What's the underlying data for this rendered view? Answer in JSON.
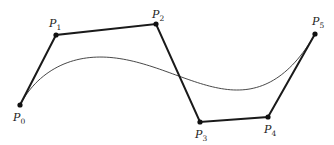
{
  "diagram": {
    "type": "bezier-curve-control-polygon",
    "points": [
      {
        "name": "P",
        "sub": "0",
        "x": 20,
        "y": 105,
        "lx": 13,
        "ly": 121
      },
      {
        "name": "P",
        "sub": "1",
        "x": 56,
        "y": 35,
        "lx": 49,
        "ly": 27
      },
      {
        "name": "P",
        "sub": "2",
        "x": 156,
        "y": 24,
        "lx": 152,
        "ly": 18
      },
      {
        "name": "P",
        "sub": "3",
        "x": 200,
        "y": 122,
        "lx": 195,
        "ly": 138
      },
      {
        "name": "P",
        "sub": "4",
        "x": 268,
        "y": 117,
        "lx": 264,
        "ly": 133
      },
      {
        "name": "P",
        "sub": "5",
        "x": 315,
        "y": 34,
        "lx": 312,
        "ly": 25
      }
    ],
    "polygon_color": "#1a1a1a",
    "curve_color": "#333333"
  }
}
